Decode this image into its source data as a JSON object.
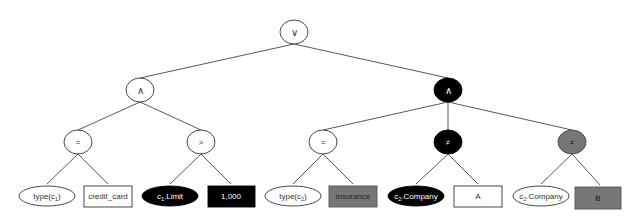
{
  "diagram": {
    "type": "expression-tree",
    "colors": {
      "white": "#ffffff",
      "black": "#000000",
      "gray": "#777777",
      "stroke": "#333333",
      "edge": "#444444"
    },
    "nodes": {
      "root": {
        "label": "∨",
        "shape": "circle",
        "fill": "white"
      },
      "and_left": {
        "label": "∧",
        "shape": "circle",
        "fill": "white"
      },
      "and_right": {
        "label": "∧",
        "shape": "circle",
        "fill": "black"
      },
      "eq_left": {
        "label": "=",
        "shape": "circle",
        "fill": "white"
      },
      "gt": {
        "label": ">",
        "shape": "circle",
        "fill": "white"
      },
      "eq_right": {
        "label": "=",
        "shape": "circle",
        "fill": "white"
      },
      "neq_black": {
        "label": "≠",
        "shape": "circle",
        "fill": "black"
      },
      "neq_gray": {
        "label": "≠",
        "shape": "circle",
        "fill": "gray"
      }
    },
    "leaves": {
      "type_c1": {
        "text": "type(c",
        "sub": "1",
        "suffix": ")",
        "shape": "ellipse",
        "fill": "white"
      },
      "credit_card": {
        "text": "credit_card",
        "shape": "rect",
        "fill": "white"
      },
      "c1_limit": {
        "text": "c",
        "sub": "1",
        "suffix": ".Limit",
        "shape": "ellipse",
        "fill": "black"
      },
      "val_1000": {
        "text": "1,000",
        "shape": "rect",
        "fill": "black"
      },
      "type_c2": {
        "text": "type(c",
        "sub": "2",
        "suffix": ")",
        "shape": "ellipse",
        "fill": "white"
      },
      "insurance": {
        "text": "insurance",
        "shape": "rect",
        "fill": "gray"
      },
      "c2_company_black": {
        "text": "c",
        "sub": "2",
        "suffix": ".Company",
        "shape": "ellipse",
        "fill": "black"
      },
      "val_a": {
        "text": "A",
        "shape": "rect",
        "fill": "white"
      },
      "c2_company_white": {
        "text": "c",
        "sub": "2",
        "suffix": ".Company",
        "shape": "ellipse",
        "fill": "white"
      },
      "val_b": {
        "text": "B",
        "shape": "rect",
        "fill": "gray"
      }
    },
    "edges": [
      [
        "root",
        "and_left"
      ],
      [
        "root",
        "and_right"
      ],
      [
        "and_left",
        "eq_left"
      ],
      [
        "and_left",
        "gt"
      ],
      [
        "and_right",
        "eq_right"
      ],
      [
        "and_right",
        "neq_black"
      ],
      [
        "and_right",
        "neq_gray"
      ],
      [
        "eq_left",
        "type_c1"
      ],
      [
        "eq_left",
        "credit_card"
      ],
      [
        "gt",
        "c1_limit"
      ],
      [
        "gt",
        "val_1000"
      ],
      [
        "eq_right",
        "type_c2"
      ],
      [
        "eq_right",
        "insurance"
      ],
      [
        "neq_black",
        "c2_company_black"
      ],
      [
        "neq_black",
        "val_a"
      ],
      [
        "neq_gray",
        "c2_company_white"
      ],
      [
        "neq_gray",
        "val_b"
      ]
    ]
  }
}
